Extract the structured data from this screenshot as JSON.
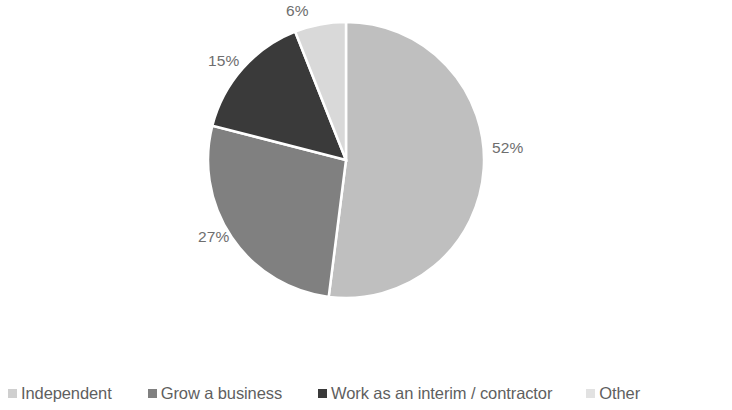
{
  "chart_data": {
    "type": "pie",
    "title": "",
    "subtitle": "",
    "xlabel": "",
    "ylabel": "",
    "grid": false,
    "legend_position": "bottom",
    "start_angle_deg": 0,
    "direction": "clockwise",
    "categories": [
      "Independent",
      "Grow a business",
      "Work as an interim / contractor",
      "Other"
    ],
    "values": [
      52,
      27,
      15,
      6
    ],
    "value_unit": "%",
    "data_labels": [
      "52%",
      "27%",
      "15%",
      "6%"
    ],
    "colors": [
      "#bfbfbf",
      "#808080",
      "#3a3a3a",
      "#d9d9d9"
    ],
    "slices": [
      {
        "label": "Independent",
        "value": 52,
        "data_label": "52%",
        "color": "#bfbfbf"
      },
      {
        "label": "Grow a business",
        "value": 27,
        "data_label": "27%",
        "color": "#808080"
      },
      {
        "label": "Work as an interim / contractor",
        "value": 15,
        "data_label": "15%",
        "color": "#3a3a3a"
      },
      {
        "label": "Other",
        "value": 6,
        "data_label": "6%",
        "color": "#d9d9d9"
      }
    ]
  },
  "labels": {
    "independent_pct": "52%",
    "grow_pct": "27%",
    "interim_pct": "15%",
    "other_pct": "6%"
  },
  "legend": {
    "items": [
      {
        "label": "Independent",
        "color": "#cfcfcf"
      },
      {
        "label": "Grow a business",
        "color": "#808080"
      },
      {
        "label": "Work as an interim / contractor",
        "color": "#3a3a3a"
      },
      {
        "label": "Other",
        "color": "#e2e2e2"
      }
    ]
  },
  "style": {
    "background": "#ffffff",
    "label_color": "#6e6e6e",
    "legend_text_color": "#5f5f5f",
    "slice_border_color": "#ffffff"
  }
}
